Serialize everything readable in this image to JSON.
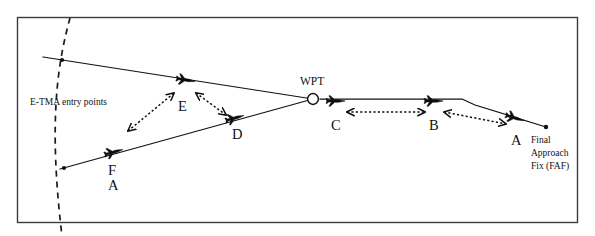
{
  "figure": {
    "frame": {
      "stroke_color": "#3b3b3b"
    },
    "line_color": "#111111",
    "background": "#ffffff"
  },
  "labels": {
    "entry_points": "E-TMA entry points",
    "waypoint": "WPT",
    "faf_line1": "Final",
    "faf_line2": "Approach",
    "faf_line3": "Fix (FAF)"
  },
  "aircraft": [
    {
      "id": "A",
      "label": "A",
      "leg": "final-approach",
      "x": 515,
      "y": 118
    },
    {
      "id": "B",
      "label": "B",
      "leg": "final-approach",
      "x": 434,
      "y": 102
    },
    {
      "id": "C",
      "label": "C",
      "leg": "final-approach",
      "x": 336,
      "y": 102
    },
    {
      "id": "D",
      "label": "D",
      "leg": "south-arrival",
      "x": 235,
      "y": 118
    },
    {
      "id": "E",
      "label": "E",
      "leg": "north-arrival",
      "x": 186,
      "y": 80
    },
    {
      "id": "FA",
      "label": "F",
      "label2": "A",
      "leg": "south-arrival",
      "x": 114,
      "y": 152
    }
  ],
  "spacing_arrows": [
    {
      "from": "C",
      "to": "B",
      "style": "dotted-double-headed"
    },
    {
      "from": "B",
      "to": "A",
      "style": "dotted-double-headed"
    },
    {
      "from": "E",
      "to": "FA",
      "style": "dotted-double-headed"
    },
    {
      "from": "E",
      "to": "D",
      "style": "dotted-double-headed"
    }
  ],
  "routes": [
    {
      "name": "north-arrival",
      "from": "north entry point",
      "to": "WPT"
    },
    {
      "name": "south-arrival",
      "from": "south entry point",
      "to": "WPT"
    },
    {
      "name": "final-approach",
      "from": "WPT",
      "to": "Final Approach Fix (FAF)"
    }
  ],
  "entry_points": [
    {
      "name": "north-entry-point",
      "x": 43,
      "y": 57
    },
    {
      "name": "south-entry-point",
      "x": 60,
      "y": 169
    }
  ],
  "waypoint": {
    "name": "WPT",
    "x": 313,
    "y": 99
  },
  "faf": {
    "name": "Final Approach Fix (FAF)",
    "x": 546,
    "y": 127
  }
}
